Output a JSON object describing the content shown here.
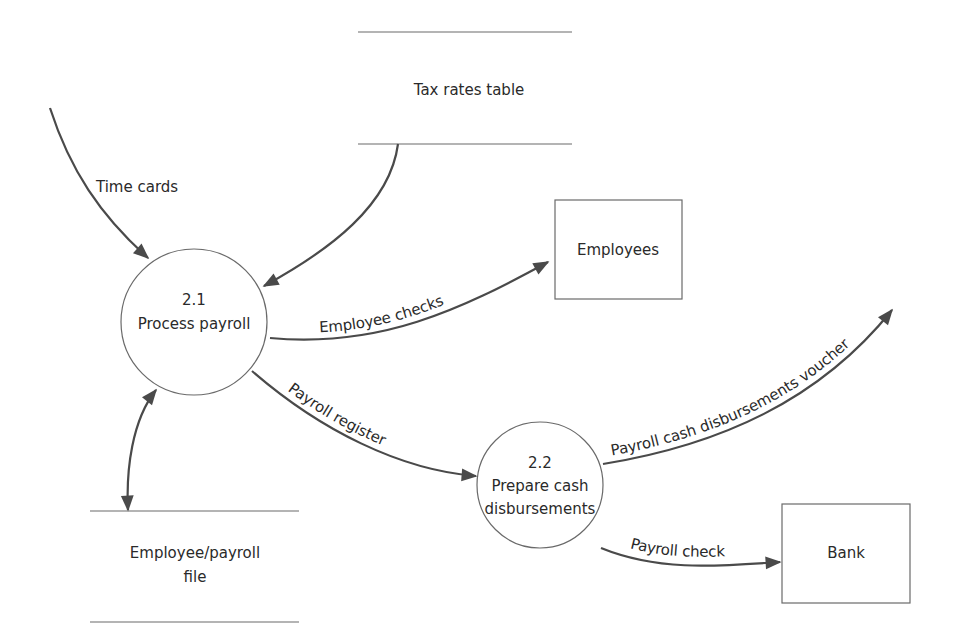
{
  "diagram": {
    "type": "data-flow-diagram",
    "colors": {
      "line": "#4a4a4a",
      "shape": "#6a6a6a",
      "text": "#2a2a2a",
      "background": "#ffffff"
    },
    "processes": [
      {
        "id": "p21",
        "number": "2.1",
        "name": "Process payroll"
      },
      {
        "id": "p22",
        "number": "2.2",
        "name_line1": "Prepare cash",
        "name_line2": "disbursements"
      }
    ],
    "data_stores": [
      {
        "id": "tax",
        "name": "Tax rates table"
      },
      {
        "id": "emp_file",
        "name_line1": "Employee/payroll",
        "name_line2": "file"
      }
    ],
    "entities": [
      {
        "id": "employees",
        "name": "Employees"
      },
      {
        "id": "bank",
        "name": "Bank"
      }
    ],
    "flows": [
      {
        "id": "time_cards",
        "label": "Time cards",
        "from": "external",
        "to": "p21"
      },
      {
        "id": "tax_rates",
        "label": "",
        "from": "tax",
        "to": "p21"
      },
      {
        "id": "employee_checks",
        "label": "Employee checks",
        "from": "p21",
        "to": "employees"
      },
      {
        "id": "payroll_register",
        "label": "Payroll register",
        "from": "p21",
        "to": "p22"
      },
      {
        "id": "voucher",
        "label": "Payroll cash disbursements voucher",
        "from": "p22",
        "to": "external"
      },
      {
        "id": "payroll_check",
        "label": "Payroll check",
        "from": "p22",
        "to": "bank"
      },
      {
        "id": "emp_file_flow",
        "label": "",
        "from": "emp_file",
        "to": "p21",
        "bidirectional": true
      }
    ]
  }
}
